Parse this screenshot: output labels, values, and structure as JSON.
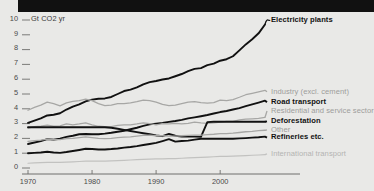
{
  "figure": {
    "unit_label": "Gt CO2 yr",
    "background_color": "#e9e9e7",
    "bold_line_color": "#111111",
    "faint_line_color": "#a7a7a5",
    "faintest_line_color": "#c2c2c0",
    "axis_color": "#6e6e6c"
  },
  "chart_data": {
    "type": "line",
    "title": "",
    "subtitle": "",
    "xlabel": "",
    "ylabel": "Gt CO2 yr",
    "xlim": [
      1970,
      2007
    ],
    "ylim": [
      0,
      10
    ],
    "grid": false,
    "legend_position": "right-inline",
    "xticks": [
      1970,
      1980,
      1990,
      2000
    ],
    "yticks": [
      0,
      1,
      2,
      3,
      4,
      5,
      6,
      7,
      8,
      9,
      10
    ],
    "x": [
      1970,
      1971,
      1972,
      1973,
      1974,
      1975,
      1976,
      1977,
      1978,
      1979,
      1980,
      1981,
      1982,
      1983,
      1984,
      1985,
      1986,
      1987,
      1988,
      1989,
      1990,
      1991,
      1992,
      1993,
      1994,
      1995,
      1996,
      1997,
      1998,
      1999,
      2000,
      2001,
      2002,
      2003,
      2004,
      2005,
      2006,
      2007
    ],
    "series": [
      {
        "name": "Electricity plants",
        "style": "bold",
        "color": "#111111",
        "label_y": 10.0,
        "values": [
          3.05,
          3.2,
          3.35,
          3.55,
          3.6,
          3.7,
          3.95,
          4.15,
          4.3,
          4.5,
          4.62,
          4.68,
          4.7,
          4.8,
          5.0,
          5.2,
          5.3,
          5.45,
          5.65,
          5.8,
          5.88,
          5.98,
          6.05,
          6.2,
          6.35,
          6.55,
          6.7,
          6.75,
          6.95,
          7.05,
          7.25,
          7.35,
          7.55,
          7.95,
          8.35,
          8.7,
          9.1,
          9.7
        ]
      },
      {
        "name": "Industry (excl. cement)",
        "style": "faint",
        "color": "#a7a7a5",
        "label_y": 5.15,
        "values": [
          3.9,
          4.1,
          4.25,
          4.45,
          4.35,
          4.2,
          4.4,
          4.5,
          4.55,
          4.65,
          4.55,
          4.35,
          4.22,
          4.25,
          4.35,
          4.35,
          4.4,
          4.48,
          4.58,
          4.55,
          4.45,
          4.3,
          4.22,
          4.25,
          4.35,
          4.45,
          4.48,
          4.42,
          4.38,
          4.42,
          4.58,
          4.55,
          4.62,
          4.78,
          4.95,
          5.05,
          5.15,
          5.25
        ]
      },
      {
        "name": "Road transport",
        "style": "bold",
        "color": "#111111",
        "label_y": 4.45,
        "values": [
          1.62,
          1.72,
          1.82,
          1.95,
          1.92,
          1.98,
          2.1,
          2.18,
          2.28,
          2.3,
          2.28,
          2.28,
          2.32,
          2.38,
          2.45,
          2.52,
          2.62,
          2.72,
          2.85,
          2.95,
          3.0,
          3.05,
          3.12,
          3.18,
          3.25,
          3.35,
          3.42,
          3.5,
          3.58,
          3.68,
          3.78,
          3.85,
          3.95,
          4.05,
          4.18,
          4.3,
          4.42,
          4.55
        ]
      },
      {
        "name": "Residential and service sector",
        "style": "faint",
        "color": "#a7a7a5",
        "label_y": 3.85,
        "values": [
          2.7,
          2.8,
          2.82,
          2.9,
          2.82,
          2.85,
          2.98,
          2.92,
          2.98,
          3.05,
          2.92,
          2.82,
          2.8,
          2.8,
          2.88,
          2.92,
          2.92,
          2.98,
          3.05,
          3.0,
          2.92,
          3.0,
          2.98,
          3.02,
          2.98,
          3.02,
          3.1,
          3.05,
          3.02,
          3.05,
          3.1,
          3.15,
          3.15,
          3.25,
          3.3,
          3.32,
          3.35,
          3.42
        ]
      },
      {
        "name": "Deforestation",
        "style": "bold",
        "color": "#111111",
        "label_y": 3.15,
        "values": [
          2.75,
          2.75,
          2.75,
          2.75,
          2.75,
          2.75,
          2.75,
          2.75,
          2.75,
          2.75,
          2.75,
          2.75,
          2.75,
          2.72,
          2.65,
          2.58,
          2.5,
          2.42,
          2.35,
          2.28,
          2.2,
          2.15,
          2.3,
          2.18,
          2.12,
          2.12,
          2.12,
          2.1,
          3.1,
          3.12,
          3.12,
          3.12,
          3.12,
          3.12,
          3.12,
          3.12,
          3.12,
          3.12
        ]
      },
      {
        "name": "Other",
        "style": "faint",
        "color": "#a7a7a5",
        "label_y": 2.58,
        "values": [
          1.8,
          1.85,
          1.88,
          1.95,
          1.92,
          1.92,
          1.98,
          2.0,
          2.05,
          2.1,
          2.05,
          2.0,
          1.98,
          2.0,
          2.05,
          2.08,
          2.1,
          2.15,
          2.2,
          2.22,
          2.18,
          2.18,
          2.15,
          2.15,
          2.18,
          2.2,
          2.22,
          2.22,
          2.25,
          2.28,
          2.32,
          2.32,
          2.35,
          2.4,
          2.45,
          2.48,
          2.52,
          2.55
        ]
      },
      {
        "name": "Refineries etc.",
        "style": "bold",
        "color": "#111111",
        "label_y": 2.05,
        "values": [
          1.0,
          1.02,
          1.05,
          1.1,
          1.05,
          1.02,
          1.08,
          1.15,
          1.22,
          1.3,
          1.28,
          1.25,
          1.25,
          1.28,
          1.32,
          1.38,
          1.42,
          1.48,
          1.55,
          1.62,
          1.7,
          1.82,
          1.95,
          1.78,
          1.82,
          1.85,
          1.92,
          1.98,
          1.98,
          1.98,
          1.98,
          1.98,
          1.98,
          2.0,
          2.02,
          2.05,
          2.08,
          2.12
        ]
      },
      {
        "name": "International transport",
        "style": "faintest",
        "color": "#c2c2c0",
        "label_y": 0.95,
        "values": [
          0.32,
          0.34,
          0.36,
          0.38,
          0.38,
          0.38,
          0.4,
          0.42,
          0.44,
          0.46,
          0.46,
          0.46,
          0.46,
          0.48,
          0.5,
          0.52,
          0.54,
          0.56,
          0.58,
          0.6,
          0.62,
          0.62,
          0.64,
          0.64,
          0.66,
          0.68,
          0.7,
          0.72,
          0.74,
          0.76,
          0.78,
          0.78,
          0.8,
          0.82,
          0.84,
          0.86,
          0.88,
          0.9
        ]
      }
    ]
  }
}
